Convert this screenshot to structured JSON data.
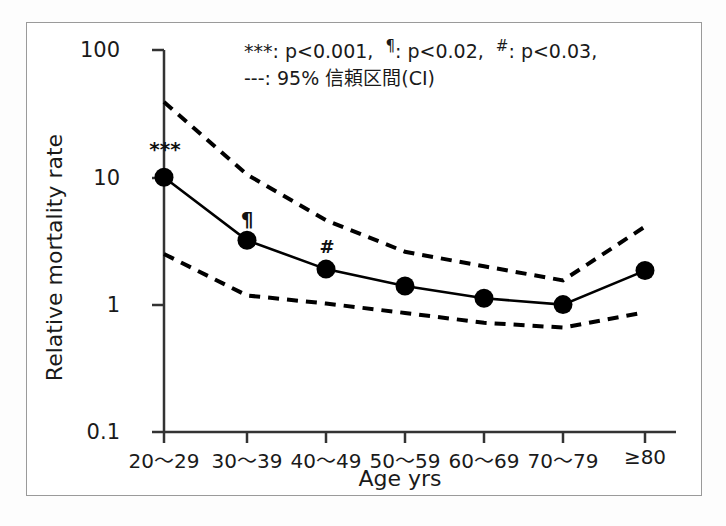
{
  "chart_data": {
    "type": "line",
    "title": "",
    "xlabel": "Age yrs",
    "ylabel": "Relative mortality rate",
    "yscale": "log",
    "ylim": [
      0.1,
      100
    ],
    "ytick_labels": [
      "100",
      "10",
      "1",
      "0.1"
    ],
    "ytick_values": [
      100,
      10,
      1,
      0.1
    ],
    "grid": false,
    "categories": [
      "20〜29",
      "30〜39",
      "40〜49",
      "50〜59",
      "60〜69",
      "70〜79",
      "≥80"
    ],
    "series": [
      {
        "name": "Relative mortality rate",
        "style": "solid-with-markers",
        "values": [
          10.0,
          3.2,
          1.9,
          1.4,
          1.12,
          1.0,
          1.85
        ]
      },
      {
        "name": "95% CI upper",
        "style": "dashed",
        "values": [
          39.0,
          10.5,
          4.6,
          2.6,
          2.0,
          1.55,
          4.1
        ]
      },
      {
        "name": "95% CI lower",
        "style": "dashed",
        "values": [
          2.5,
          1.18,
          1.02,
          0.86,
          0.72,
          0.66,
          0.87
        ]
      }
    ],
    "annotations": [
      {
        "label": "***",
        "category": "20〜29",
        "value": 10.0
      },
      {
        "label": "¶",
        "category": "30〜39",
        "value": 3.2
      },
      {
        "label": "#",
        "category": "40〜49",
        "value": 1.9
      }
    ],
    "legend_position": "top-center",
    "legend_entries": [
      {
        "symbol": "***",
        "text": ": p<0.001,"
      },
      {
        "symbol": "¶",
        "text": ": p<0.02,"
      },
      {
        "symbol": "#",
        "text": ": p<0.03,"
      },
      {
        "symbol": "---",
        "text": ": 95% 信頼区間(CI)"
      }
    ]
  },
  "legend": {
    "line1_part1_symbol": "***",
    "line1_part1_text": ": p<0.001,",
    "line1_part2_symbol": "¶",
    "line1_part2_text": ": p<0.02,",
    "line1_part3_symbol": "#",
    "line1_part3_text": ": p<0.03,",
    "line2_symbol": "---",
    "line2_text": ": 95% 信頼区間(CI)"
  },
  "axes": {
    "y_title": "Relative mortality rate",
    "x_title": "Age yrs",
    "y_ticks": [
      "100",
      "10",
      "1",
      "0.1"
    ],
    "x_ticks": [
      "20〜29",
      "30〜39",
      "40〜49",
      "50〜59",
      "60〜69",
      "70〜79",
      "≥80"
    ]
  },
  "markers": {
    "m1": "***",
    "m2": "¶",
    "m3": "#"
  },
  "colors": {
    "line": "#000000",
    "ci": "#000000",
    "axis": "#333333",
    "border": "#9a9a9a",
    "text": "#1a1a1a"
  }
}
